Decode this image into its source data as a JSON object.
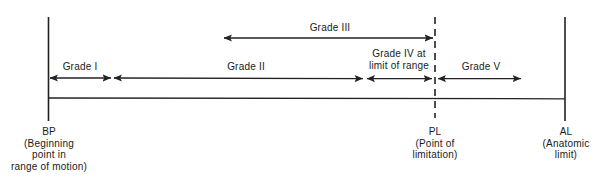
{
  "diagram": {
    "type": "range-of-motion-grade-scale",
    "stroke_color": "#222222",
    "background_color": "#ffffff",
    "text_color": "#1a1a1a"
  },
  "endpoints": [
    {
      "id": "bp",
      "abbr": "BP",
      "expansion_line1": "(Beginning",
      "expansion_line2": "point in",
      "expansion_line3": "range of motion)",
      "x": 49,
      "line_style": "solid"
    },
    {
      "id": "pl",
      "abbr": "PL",
      "expansion_line1": "(Point of",
      "expansion_line2": "limitation)",
      "x": 435,
      "line_style": "dashed"
    },
    {
      "id": "al",
      "abbr": "AL",
      "expansion_line1": "(Anatomic",
      "expansion_line2": "limit)",
      "x": 565,
      "line_style": "solid"
    }
  ],
  "grades": [
    {
      "id": "grade-1",
      "label": "Grade I",
      "label_line2": "",
      "row": "lower",
      "start_x": 50,
      "end_x": 111,
      "label_x": 80,
      "arrowheads": "both"
    },
    {
      "id": "grade-2",
      "label": "Grade II",
      "label_line2": "",
      "row": "lower",
      "start_x": 114,
      "end_x": 363,
      "label_x": 246,
      "arrowheads": "both"
    },
    {
      "id": "grade-3",
      "label": "Grade III",
      "label_line2": "",
      "row": "upper",
      "start_x": 224,
      "end_x": 433,
      "label_x": 330,
      "arrowheads": "both"
    },
    {
      "id": "grade-4",
      "label": "Grade IV at",
      "label_line2": "limit of range",
      "row": "lower",
      "start_x": 367,
      "end_x": 432,
      "label_x": 399,
      "arrowheads": "both"
    },
    {
      "id": "grade-5",
      "label": "Grade V",
      "label_line2": "",
      "row": "lower",
      "start_x": 438,
      "end_x": 521,
      "label_x": 481,
      "arrowheads": "both"
    }
  ],
  "baseline": {
    "y": 98,
    "start_x": 48,
    "end_x": 565
  }
}
